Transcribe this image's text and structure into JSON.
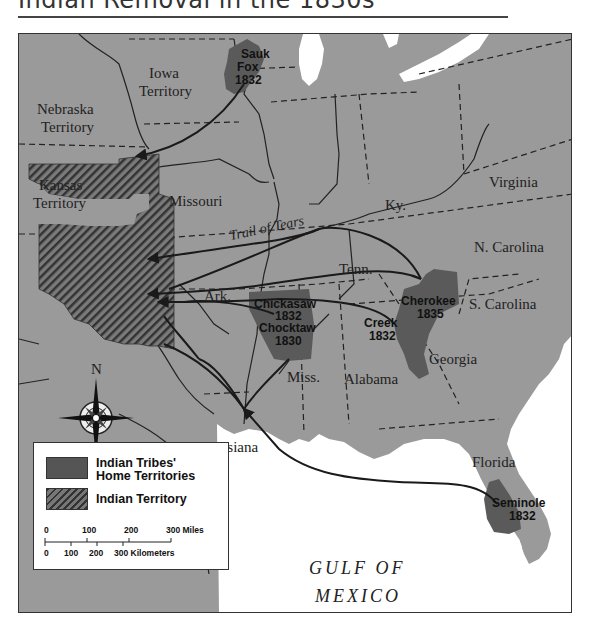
{
  "title": "Indian Removal in the 1830s",
  "map": {
    "territories": [
      {
        "name": "Nebraska Territory",
        "lines": [
          "Nebraska",
          "Territory"
        ]
      },
      {
        "name": "Iowa Territory",
        "lines": [
          "Iowa",
          "Territory"
        ]
      },
      {
        "name": "Kansas Territory",
        "lines": [
          "Kansas",
          "Territory"
        ]
      }
    ],
    "states": {
      "missouri": "Missouri",
      "ky": "Ky.",
      "virginia": "Virginia",
      "n_carolina": "N. Carolina",
      "tenn": "Tenn.",
      "s_carolina": "S. Carolina",
      "ark": "Ark.",
      "georgia": "Georgia",
      "alabama": "Alabama",
      "miss": "Miss.",
      "louisiana": "Louisiana",
      "florida": "Florida"
    },
    "tribes": [
      {
        "name": "Sauk",
        "name2": "Fox",
        "year": "1832"
      },
      {
        "name": "Chickasaw",
        "year": "1832"
      },
      {
        "name": "Chocktaw",
        "year": "1830"
      },
      {
        "name": "Creek",
        "year": "1832"
      },
      {
        "name": "Cherokee",
        "year": "1835"
      },
      {
        "name": "Seminole",
        "year": "1832"
      }
    ],
    "trail_label": "Trail of Tears",
    "gulf_label": [
      "GULF OF",
      "MEXICO"
    ],
    "compass_north": "N",
    "colors": {
      "land": "#9a9a9a",
      "water": "#ffffff",
      "home_territory": "#5a5a5a",
      "indian_territory_hatch": "#3a3a3a",
      "routes": "#1a1a1a"
    }
  },
  "legend": {
    "items": [
      {
        "label_line1": "Indian Tribes'",
        "label_line2": "Home Territories"
      },
      {
        "label_line1": "Indian Territory"
      }
    ],
    "scale": {
      "miles_ticks": [
        "0",
        "100",
        "200",
        "300 Miles"
      ],
      "km_ticks": [
        "0",
        "100",
        "200",
        "300 Kilometers"
      ]
    }
  }
}
